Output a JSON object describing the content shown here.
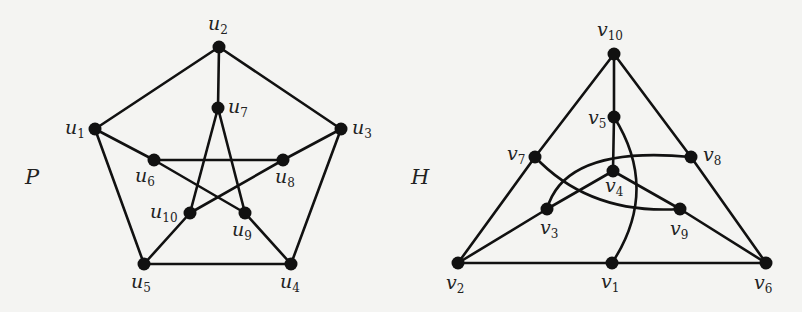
{
  "figure": {
    "graphs": [
      {
        "id": "P",
        "name": "P",
        "name_pos": [
          25,
          165
        ],
        "vertices": [
          {
            "id": "u1",
            "base": "u",
            "sub": "1",
            "x": 95,
            "y": 129,
            "lx": 65,
            "ly": 118
          },
          {
            "id": "u2",
            "base": "u",
            "sub": "2",
            "x": 219,
            "y": 47,
            "lx": 208,
            "ly": 14
          },
          {
            "id": "u3",
            "base": "u",
            "sub": "3",
            "x": 341,
            "y": 129,
            "lx": 352,
            "ly": 118
          },
          {
            "id": "u4",
            "base": "u",
            "sub": "4",
            "x": 291,
            "y": 264,
            "lx": 280,
            "ly": 272
          },
          {
            "id": "u5",
            "base": "u",
            "sub": "5",
            "x": 144,
            "y": 264,
            "lx": 131,
            "ly": 272
          },
          {
            "id": "u6",
            "base": "u",
            "sub": "6",
            "x": 154,
            "y": 160,
            "lx": 135,
            "ly": 166
          },
          {
            "id": "u7",
            "base": "u",
            "sub": "7",
            "x": 218,
            "y": 108,
            "lx": 228,
            "ly": 97
          },
          {
            "id": "u8",
            "base": "u",
            "sub": "8",
            "x": 283,
            "y": 160,
            "lx": 275,
            "ly": 167
          },
          {
            "id": "u9",
            "base": "u",
            "sub": "9",
            "x": 245,
            "y": 213,
            "lx": 232,
            "ly": 220
          },
          {
            "id": "u10",
            "base": "u",
            "sub": "10",
            "x": 190,
            "y": 213,
            "lx": 150,
            "ly": 202
          }
        ],
        "edges": [
          [
            "u1",
            "u2"
          ],
          [
            "u2",
            "u3"
          ],
          [
            "u3",
            "u4"
          ],
          [
            "u4",
            "u5"
          ],
          [
            "u5",
            "u1"
          ],
          [
            "u2",
            "u7"
          ],
          [
            "u1",
            "u6"
          ],
          [
            "u3",
            "u8"
          ],
          [
            "u4",
            "u9"
          ],
          [
            "u5",
            "u10"
          ],
          [
            "u6",
            "u8"
          ],
          [
            "u8",
            "u10"
          ],
          [
            "u10",
            "u7"
          ],
          [
            "u7",
            "u9"
          ],
          [
            "u9",
            "u6"
          ]
        ]
      },
      {
        "id": "H",
        "name": "H",
        "name_pos": [
          411,
          165
        ],
        "vertices": [
          {
            "id": "v1",
            "base": "v",
            "sub": "1",
            "x": 612,
            "y": 263,
            "lx": 601,
            "ly": 272
          },
          {
            "id": "v2",
            "base": "v",
            "sub": "2",
            "x": 458,
            "y": 263,
            "lx": 446,
            "ly": 273
          },
          {
            "id": "v3",
            "base": "v",
            "sub": "3",
            "x": 547,
            "y": 209,
            "lx": 540,
            "ly": 218
          },
          {
            "id": "v4",
            "base": "v",
            "sub": "4",
            "x": 613,
            "y": 171,
            "lx": 605,
            "ly": 176
          },
          {
            "id": "v5",
            "base": "v",
            "sub": "5",
            "x": 614,
            "y": 117,
            "lx": 588,
            "ly": 108
          },
          {
            "id": "v6",
            "base": "v",
            "sub": "6",
            "x": 766,
            "y": 263,
            "lx": 754,
            "ly": 273
          },
          {
            "id": "v7",
            "base": "v",
            "sub": "7",
            "x": 535,
            "y": 157,
            "lx": 507,
            "ly": 144
          },
          {
            "id": "v8",
            "base": "v",
            "sub": "8",
            "x": 691,
            "y": 157,
            "lx": 703,
            "ly": 145
          },
          {
            "id": "v9",
            "base": "v",
            "sub": "9",
            "x": 680,
            "y": 209,
            "lx": 670,
            "ly": 219
          },
          {
            "id": "v10",
            "base": "v",
            "sub": "10",
            "x": 614,
            "y": 54,
            "lx": 597,
            "ly": 20
          }
        ],
        "edges": [
          [
            "v10",
            "v7"
          ],
          [
            "v10",
            "v8"
          ],
          [
            "v10",
            "v5"
          ],
          [
            "v7",
            "v2"
          ],
          [
            "v8",
            "v6"
          ],
          [
            "v2",
            "v1"
          ],
          [
            "v1",
            "v6"
          ],
          [
            "v5",
            "v4"
          ],
          [
            "v4",
            "v3"
          ],
          [
            "v4",
            "v9"
          ],
          [
            "v3",
            "v2"
          ],
          [
            "v9",
            "v6"
          ]
        ],
        "curved_edges": [
          {
            "from": "v7",
            "to": "v9",
            "path": "M535,157 Q590,215 680,209"
          },
          {
            "from": "v3",
            "to": "v8",
            "path": "M547,209 Q565,145 691,157"
          },
          {
            "from": "v5",
            "to": "v1",
            "path": "M614,117 Q660,190 612,263"
          }
        ]
      }
    ]
  }
}
